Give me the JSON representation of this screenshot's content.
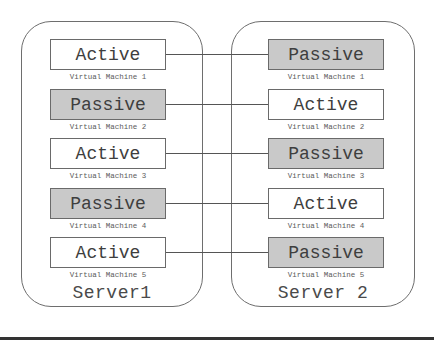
{
  "diagram": {
    "type": "active-passive server failover",
    "servers": [
      {
        "label": "Server1",
        "vms": [
          {
            "state": "Active",
            "caption": "Virtual Machine 1"
          },
          {
            "state": "Passive",
            "caption": "Virtual Machine 2"
          },
          {
            "state": "Active",
            "caption": "Virtual Machine 3"
          },
          {
            "state": "Passive",
            "caption": "Virtual Machine 4"
          },
          {
            "state": "Active",
            "caption": "Virtual Machine 5"
          }
        ]
      },
      {
        "label": "Server 2",
        "vms": [
          {
            "state": "Passive",
            "caption": "Virtual Machine 1"
          },
          {
            "state": "Active",
            "caption": "Virtual Machine 2"
          },
          {
            "state": "Passive",
            "caption": "Virtual Machine 3"
          },
          {
            "state": "Active",
            "caption": "Virtual Machine 4"
          },
          {
            "state": "Passive",
            "caption": "Virtual Machine 5"
          }
        ]
      }
    ],
    "connections": [
      {
        "from": "Server1.VM1",
        "to": "Server2.VM1"
      },
      {
        "from": "Server1.VM2",
        "to": "Server2.VM2"
      },
      {
        "from": "Server1.VM3",
        "to": "Server2.VM3"
      },
      {
        "from": "Server1.VM4",
        "to": "Server2.VM4"
      },
      {
        "from": "Server1.VM5",
        "to": "Server2.VM5"
      }
    ],
    "colors": {
      "active_fill": "#ffffff",
      "passive_fill": "#c9c9c9",
      "border": "#6a6a6a",
      "text": "#3e3e3e"
    }
  }
}
